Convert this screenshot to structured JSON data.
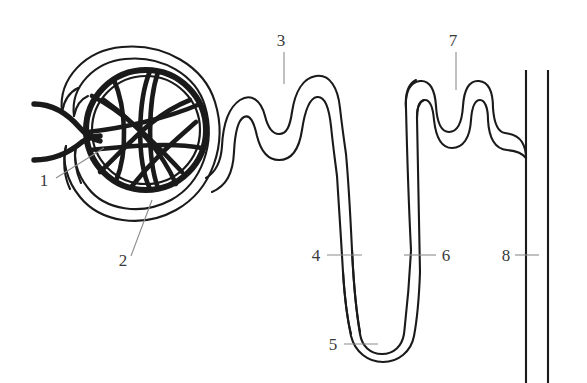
{
  "figure": {
    "type": "anatomical-line-diagram",
    "background_color": "#ffffff",
    "ink_color": "#1a1a1a",
    "label_color": "#3a3a3a",
    "width": 587,
    "height": 383
  },
  "labels": [
    {
      "id": "label-1",
      "text": "1",
      "x": 44,
      "y": 186,
      "leader": {
        "type": "diagonal",
        "x1": 56,
        "y1": 178,
        "x2": 104,
        "y2": 148
      }
    },
    {
      "id": "label-2",
      "text": "2",
      "x": 123,
      "y": 266,
      "leader": {
        "type": "diagonal",
        "x1": 131,
        "y1": 256,
        "x2": 152,
        "y2": 200
      }
    },
    {
      "id": "label-3",
      "text": "3",
      "x": 281,
      "y": 46,
      "leader": {
        "type": "vertical",
        "x1": 284,
        "y1": 52,
        "x2": 284,
        "y2": 82
      }
    },
    {
      "id": "label-4",
      "text": "4",
      "x": 316,
      "y": 261,
      "leader": {
        "type": "horizontal",
        "x1": 327,
        "y1": 255,
        "x2": 362,
        "y2": 255
      }
    },
    {
      "id": "label-5",
      "text": "5",
      "x": 333,
      "y": 350,
      "leader": {
        "type": "horizontal",
        "x1": 344,
        "y1": 344,
        "x2": 376,
        "y2": 344
      }
    },
    {
      "id": "label-6",
      "text": "6",
      "x": 441,
      "y": 261,
      "leader": {
        "type": "horizontal",
        "x1": 436,
        "y1": 255,
        "x2": 404,
        "y2": 255
      }
    },
    {
      "id": "label-7",
      "text": "7",
      "x": 453,
      "y": 46,
      "leader": {
        "type": "vertical",
        "x1": 456,
        "y1": 52,
        "x2": 456,
        "y2": 88
      }
    },
    {
      "id": "label-8",
      "text": "8",
      "x": 504,
      "y": 261,
      "leader": {
        "type": "horizontal",
        "x1": 515,
        "y1": 255,
        "x2": 539,
        "y2": 255
      }
    }
  ],
  "parts": {
    "glomerulus": "glomerular capillary tuft",
    "bowmans_capsule": "bowmans-capsule",
    "afferent_arteriole": "afferent-arteriole",
    "efferent_arteriole": "efferent-arteriole",
    "proximal_tubule": "proximal-convoluted-tubule",
    "descending_limb": "descending-limb-loop-of-henle",
    "loop_bottom": "loop-of-henle-bend",
    "ascending_limb": "ascending-limb-loop-of-henle",
    "distal_tubule": "distal-convoluted-tubule",
    "collecting_duct": "collecting-duct"
  }
}
